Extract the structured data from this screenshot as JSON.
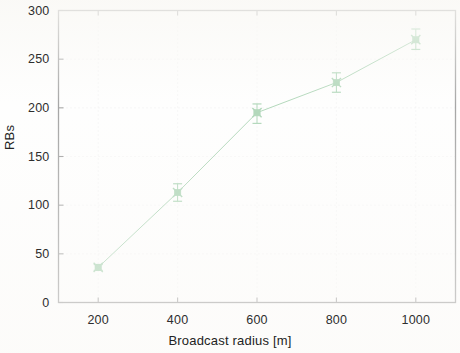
{
  "chart_data": {
    "type": "line",
    "title": "",
    "xlabel": "Broadcast radius [m]",
    "ylabel": "RBs",
    "x": [
      200,
      400,
      600,
      800,
      1000
    ],
    "values": [
      36,
      113,
      195,
      226,
      270
    ],
    "series": [
      {
        "name": "RBs",
        "values": [
          36,
          113,
          195,
          226,
          270
        ],
        "yerr_lower": [
          3,
          9,
          11,
          10,
          10
        ],
        "yerr_upper": [
          3,
          9,
          9,
          10,
          11
        ],
        "color": "#55a868",
        "marker": "x-with-square",
        "linewidth": 1
      }
    ],
    "xlim": [
      100,
      1100
    ],
    "ylim": [
      0,
      300
    ],
    "xticks": [
      200,
      400,
      600,
      800,
      1000
    ],
    "yticks": [
      0,
      50,
      100,
      150,
      200,
      250,
      300
    ],
    "xtick_labels": [
      "200",
      "400",
      "600",
      "800",
      "1000"
    ],
    "ytick_labels": [
      "0",
      "50",
      "100",
      "150",
      "200",
      "250",
      "300"
    ],
    "grid": true,
    "grid_style": "dotted",
    "legend": false,
    "legend_position": "none",
    "frame": true,
    "errorbars": true
  },
  "axes": {
    "y_title": "RBs",
    "x_title": "Broadcast radius [m]"
  },
  "colors": {
    "line": "#55a868",
    "axis": "#3a3a3a",
    "grid": "#d8d8d8",
    "text": "#2e2e2e",
    "background": "#fdfdfc"
  }
}
